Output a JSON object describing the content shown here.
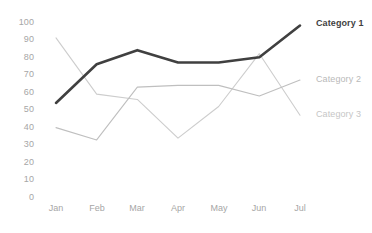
{
  "chart_data": {
    "type": "line",
    "title": "",
    "xlabel": "",
    "ylabel": "",
    "categories": [
      "Jan",
      "Feb",
      "Mar",
      "Apr",
      "May",
      "Jun",
      "Jul"
    ],
    "ylim": [
      0,
      100
    ],
    "ytick_step": 10,
    "yticks": [
      "100",
      "90",
      "80",
      "70",
      "60",
      "50",
      "40",
      "30",
      "20",
      "10",
      "0"
    ],
    "grid": false,
    "legend": "right-inline",
    "series": [
      {
        "name": "Category 1",
        "color": "#404040",
        "width": 2.6,
        "values": [
          54,
          76,
          84,
          77,
          77,
          80,
          98
        ]
      },
      {
        "name": "Category 2",
        "color": "#bfbfbf",
        "width": 1.1,
        "values": [
          40,
          33,
          63,
          64,
          64,
          58,
          67
        ]
      },
      {
        "name": "Category 3",
        "color": "#cdcdcd",
        "width": 1.1,
        "values": [
          91,
          59,
          56,
          34,
          52,
          82,
          47
        ]
      }
    ]
  },
  "axis": {
    "y": {
      "t100": "100",
      "t90": "90",
      "t80": "80",
      "t70": "70",
      "t60": "60",
      "t50": "50",
      "t40": "40",
      "t30": "30",
      "t20": "20",
      "t10": "10",
      "t0": "0"
    },
    "x": {
      "jan": "Jan",
      "feb": "Feb",
      "mar": "Mar",
      "apr": "Apr",
      "may": "May",
      "jun": "Jun",
      "jul": "Jul"
    }
  },
  "legend": {
    "category1": "Category 1",
    "category2": "Category 2",
    "category3": "Category 3"
  }
}
